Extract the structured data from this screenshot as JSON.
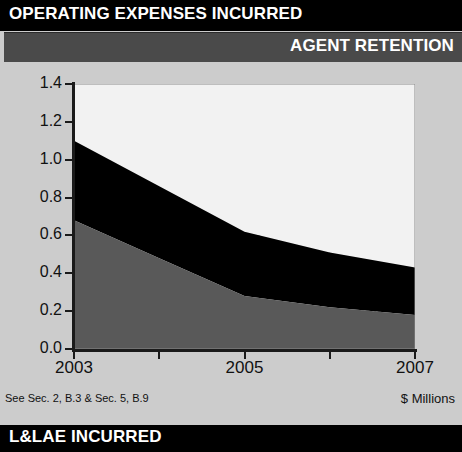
{
  "header": {
    "title": "OPERATING EXPENSES INCURRED",
    "subtitle": "AGENT RETENTION"
  },
  "footer": {
    "title": "L&LAE INCURRED"
  },
  "notes": {
    "source_reference": "See Sec. 2, B.3 & Sec. 5, B.9",
    "units": "$ Millions"
  },
  "colors": {
    "header_bar": "#000000",
    "subheader_bar": "#4a4a4a",
    "page_background": "#cccccc",
    "plot_background": "#e9e9e9",
    "series_bottom": "#595959",
    "series_middle": "#000000",
    "series_top": "#f2f2f2",
    "axis": "#1a1a1a",
    "gridline": "#8a8a8a"
  },
  "chart_data": {
    "type": "area",
    "title": "AGENT RETENTION",
    "xlabel": "",
    "ylabel": "$ Millions",
    "stacked": true,
    "grid": true,
    "legend": "none",
    "x": [
      2003,
      2004,
      2005,
      2006,
      2007
    ],
    "xtick_labels": [
      "2003",
      "",
      "2005",
      "",
      "2007"
    ],
    "xlim": [
      2003,
      2007
    ],
    "ylim": [
      0.0,
      1.4
    ],
    "ytick_labels": [
      "0.0",
      "0.2",
      "0.4",
      "0.6",
      "0.8",
      "1.0",
      "1.2",
      "1.4"
    ],
    "ytick_values": [
      0.0,
      0.2,
      0.4,
      0.6,
      0.8,
      1.0,
      1.2,
      1.4
    ],
    "series": [
      {
        "name": "Lower band",
        "values": [
          0.68,
          0.48,
          0.28,
          0.22,
          0.18
        ]
      },
      {
        "name": "Upper band",
        "values": [
          0.42,
          0.38,
          0.34,
          0.29,
          0.25
        ]
      }
    ],
    "cumulative_totals": [
      1.1,
      0.86,
      0.62,
      0.51,
      0.43
    ]
  }
}
